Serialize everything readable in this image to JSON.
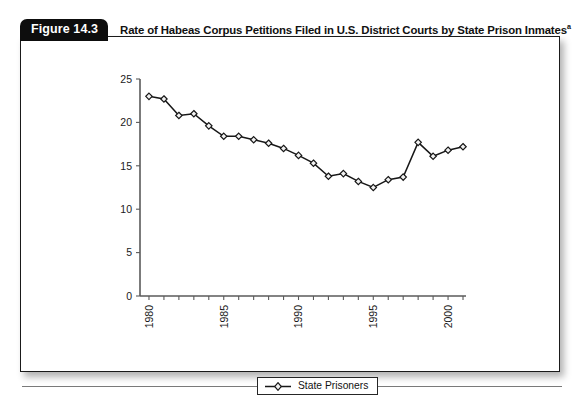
{
  "figure": {
    "badge_label": "Figure 14.3",
    "title": "Rate of Habeas Corpus Petitions Filed in U.S. District Courts by State Prison Inmates",
    "title_superscript": "a"
  },
  "legend": {
    "entries": [
      {
        "label": "State Prisoners",
        "marker": "diamond-marker",
        "color": "#171717"
      }
    ]
  },
  "colors": {
    "badge_background": "#0d0d0d",
    "badge_text": "#ffffff",
    "line": "#171717",
    "marker_fill": "#f2f2f2",
    "axis": "#5a5a5a",
    "frame": "#1a1a1a"
  },
  "chart_data": {
    "type": "line",
    "title": "Rate of Habeas Corpus Petitions Filed in U.S. District Courts by State Prison Inmates",
    "xlabel": "",
    "ylabel": "",
    "xlim": [
      1979.4,
      2001.2
    ],
    "ylim": [
      0,
      25
    ],
    "grid": false,
    "legend_position": "bottom-center",
    "yticks": [
      0,
      5,
      10,
      15,
      20,
      25
    ],
    "ytick_labels": [
      "0",
      "5",
      "10",
      "15",
      "20",
      "25"
    ],
    "xticks": [
      1980,
      1981,
      1982,
      1983,
      1984,
      1985,
      1986,
      1987,
      1988,
      1989,
      1990,
      1991,
      1992,
      1993,
      1994,
      1995,
      1996,
      1997,
      1998,
      1999,
      2000,
      2001
    ],
    "xtick_labels_shown": [
      "1980",
      "1985",
      "1990",
      "1995",
      "2000"
    ],
    "xtick_label_rotation": -90,
    "x": [
      1980,
      1981,
      1982,
      1983,
      1984,
      1985,
      1986,
      1987,
      1988,
      1989,
      1990,
      1991,
      1992,
      1993,
      1994,
      1995,
      1996,
      1997,
      1998,
      1999,
      2000,
      2001
    ],
    "series": [
      {
        "name": "State Prisoners",
        "marker": "diamond",
        "values": [
          23.0,
          22.7,
          20.8,
          21.0,
          19.6,
          18.4,
          18.4,
          18.0,
          17.6,
          17.0,
          16.2,
          15.3,
          13.8,
          14.1,
          13.2,
          12.5,
          13.4,
          13.7,
          17.7,
          16.1,
          16.8,
          17.2
        ]
      }
    ]
  }
}
